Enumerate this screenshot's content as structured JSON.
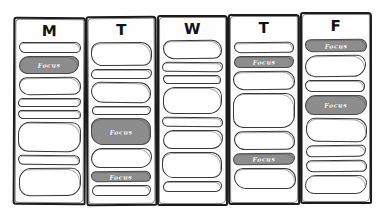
{
  "canvas": {
    "width": 385,
    "height": 218,
    "background": "#ffffff"
  },
  "style": {
    "ink_color": "#1b1b1b",
    "block_border": "#3a3a3a",
    "focus_fill": "#8d8d8d",
    "focus_text_color": "#ffffff",
    "block_fill": "#ffffff"
  },
  "focus_label": "Focus",
  "columns": [
    {
      "day": "M",
      "day_full": "Monday",
      "x": 13,
      "y": 17,
      "w": 73,
      "h": 188,
      "header_y": 22,
      "header_size": 15,
      "focus_count": 1,
      "blocks": [
        {
          "kind": "open",
          "y": 42,
          "h": 11
        },
        {
          "kind": "focus",
          "y": 56,
          "h": 18,
          "label": "Focus"
        },
        {
          "kind": "open",
          "y": 77,
          "h": 18
        },
        {
          "kind": "open",
          "y": 98,
          "h": 9
        },
        {
          "kind": "open",
          "y": 110,
          "h": 9
        },
        {
          "kind": "open",
          "y": 122,
          "h": 30
        },
        {
          "kind": "open",
          "y": 155,
          "h": 10
        },
        {
          "kind": "open",
          "y": 168,
          "h": 28
        }
      ]
    },
    {
      "day": "T",
      "day_full": "Tuesday",
      "x": 86,
      "y": 16,
      "w": 71,
      "h": 190,
      "header_y": 21,
      "header_size": 15,
      "focus_count": 2,
      "blocks": [
        {
          "kind": "open",
          "y": 42,
          "h": 24
        },
        {
          "kind": "open",
          "y": 69,
          "h": 10
        },
        {
          "kind": "open",
          "y": 82,
          "h": 21
        },
        {
          "kind": "open",
          "y": 106,
          "h": 9
        },
        {
          "kind": "focus",
          "y": 118,
          "h": 27,
          "label": "Focus"
        },
        {
          "kind": "open",
          "y": 148,
          "h": 20
        },
        {
          "kind": "focus",
          "y": 171,
          "h": 11,
          "label": "Focus"
        },
        {
          "kind": "open",
          "y": 185,
          "h": 11
        }
      ]
    },
    {
      "day": "W",
      "day_full": "Wednesday",
      "x": 157,
      "y": 15,
      "w": 71,
      "h": 191,
      "header_y": 20,
      "header_size": 15,
      "focus_count": 0,
      "blocks": [
        {
          "kind": "open",
          "y": 40,
          "h": 19
        },
        {
          "kind": "open",
          "y": 62,
          "h": 10
        },
        {
          "kind": "open",
          "y": 75,
          "h": 9
        },
        {
          "kind": "open",
          "y": 87,
          "h": 27
        },
        {
          "kind": "open",
          "y": 117,
          "h": 10
        },
        {
          "kind": "open",
          "y": 130,
          "h": 19
        },
        {
          "kind": "open",
          "y": 152,
          "h": 26
        },
        {
          "kind": "open",
          "y": 181,
          "h": 11
        }
      ]
    },
    {
      "day": "T",
      "day_full": "Thursday",
      "x": 228,
      "y": 14,
      "w": 72,
      "h": 191,
      "header_y": 19,
      "header_size": 15,
      "focus_count": 2,
      "blocks": [
        {
          "kind": "open",
          "y": 42,
          "h": 11
        },
        {
          "kind": "focus",
          "y": 56,
          "h": 12,
          "label": "Focus"
        },
        {
          "kind": "open",
          "y": 71,
          "h": 19
        },
        {
          "kind": "open",
          "y": 93,
          "h": 35
        },
        {
          "kind": "open",
          "y": 131,
          "h": 19
        },
        {
          "kind": "focus",
          "y": 153,
          "h": 12,
          "label": "Focus"
        },
        {
          "kind": "open",
          "y": 168,
          "h": 21
        }
      ]
    },
    {
      "day": "F",
      "day_full": "Friday",
      "x": 300,
      "y": 12,
      "w": 72,
      "h": 192,
      "header_y": 17,
      "header_size": 15,
      "focus_count": 2,
      "blocks": [
        {
          "kind": "focus",
          "y": 39,
          "h": 13,
          "label": "Focus"
        },
        {
          "kind": "open",
          "y": 55,
          "h": 22
        },
        {
          "kind": "open",
          "y": 80,
          "h": 12
        },
        {
          "kind": "focus",
          "y": 95,
          "h": 20,
          "label": "Focus"
        },
        {
          "kind": "open",
          "y": 118,
          "h": 24
        },
        {
          "kind": "open",
          "y": 145,
          "h": 12
        },
        {
          "kind": "open",
          "y": 160,
          "h": 12
        },
        {
          "kind": "open",
          "y": 175,
          "h": 19
        }
      ]
    }
  ]
}
